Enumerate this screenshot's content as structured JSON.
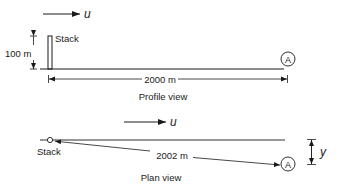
{
  "profile": {
    "wind_label": "u",
    "stack_label": "Stack",
    "height_label": "100 m",
    "distance_label": "2000 m",
    "receptor_label": "A",
    "caption": "Profile view"
  },
  "plan": {
    "wind_label": "u",
    "stack_label": "Stack",
    "distance_label": "2002 m",
    "receptor_label": "A",
    "offset_label": "y",
    "caption": "Plan view"
  },
  "colors": {
    "ink": "#1a1a1a",
    "background": "#ffffff"
  }
}
